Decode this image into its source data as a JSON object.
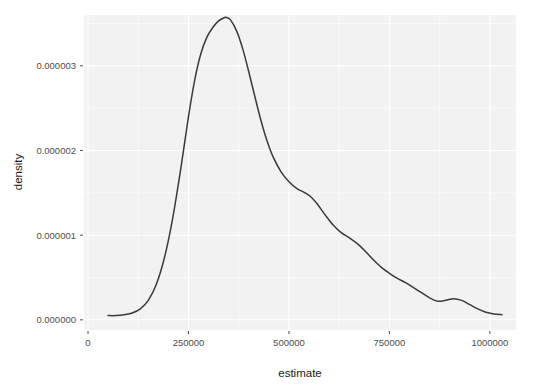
{
  "chart_data": {
    "type": "area",
    "render_style": "line",
    "title": "",
    "subtitle": "",
    "xlabel": "estimate",
    "ylabel": "density",
    "xlim": [
      -10000,
      1065000
    ],
    "ylim": [
      -1.2e-07,
      3.6e-06
    ],
    "grid": true,
    "legend": null,
    "legend_position": "none",
    "theme": "ggplot2-grey",
    "panel_background": "#f2f2f2",
    "grid_color": "#ffffff",
    "line_color": "#3a3a3a",
    "x_ticks": [
      0,
      250000,
      500000,
      750000,
      1000000
    ],
    "x_tick_labels": [
      "0",
      "250000",
      "500000",
      "750000",
      "1000000"
    ],
    "x_minor_ticks": [
      125000,
      375000,
      625000,
      875000
    ],
    "y_ticks": [
      0,
      1e-06,
      2e-06,
      3e-06
    ],
    "y_tick_labels": [
      "0.000000",
      "0.000001",
      "0.000002",
      "0.000003"
    ],
    "y_minor_ticks": [
      5e-07,
      1.5e-06,
      2.5e-06,
      3.5e-06
    ],
    "series": [
      {
        "name": "density",
        "x": [
          50000,
          70000,
          90000,
          110000,
          130000,
          150000,
          170000,
          190000,
          210000,
          230000,
          250000,
          265000,
          280000,
          295000,
          310000,
          325000,
          340000,
          345000,
          355000,
          370000,
          385000,
          400000,
          415000,
          430000,
          445000,
          460000,
          480000,
          500000,
          520000,
          540000,
          555000,
          570000,
          590000,
          610000,
          630000,
          650000,
          670000,
          690000,
          710000,
          730000,
          750000,
          770000,
          790000,
          810000,
          830000,
          850000,
          870000,
          890000,
          910000,
          930000,
          950000,
          970000,
          990000,
          1010000,
          1030000
        ],
        "y": [
          5e-08,
          5e-08,
          6e-08,
          8e-08,
          1.3e-07,
          2.3e-07,
          4.2e-07,
          7.3e-07,
          1.18e-06,
          1.76e-06,
          2.4e-06,
          2.82e-06,
          3.13e-06,
          3.33e-06,
          3.45e-06,
          3.53e-06,
          3.57e-06,
          3.57e-06,
          3.54e-06,
          3.41e-06,
          3.2e-06,
          2.93e-06,
          2.64e-06,
          2.36e-06,
          2.12e-06,
          1.93e-06,
          1.75e-06,
          1.63e-06,
          1.55e-06,
          1.5e-06,
          1.45e-06,
          1.37e-06,
          1.24e-06,
          1.12e-06,
          1.03e-06,
          9.7e-07,
          9e-07,
          8.1e-07,
          7.1e-07,
          6.2e-07,
          5.5e-07,
          4.9e-07,
          4.4e-07,
          3.8e-07,
          3.2e-07,
          2.6e-07,
          2.2e-07,
          2.3e-07,
          2.5e-07,
          2.3e-07,
          1.8e-07,
          1.3e-07,
          9e-08,
          7e-08,
          6e-08
        ]
      }
    ],
    "peak": {
      "x": 345000,
      "y": 3.57e-06
    }
  }
}
